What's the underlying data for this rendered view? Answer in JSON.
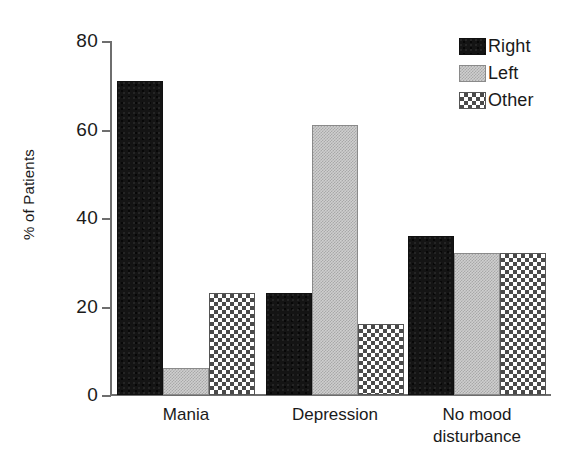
{
  "chart_data": {
    "type": "bar",
    "title": "",
    "subtitle": "",
    "xlabel": "",
    "ylabel": "% of Patients",
    "ylim": [
      0,
      80
    ],
    "yticks": [
      0,
      20,
      40,
      60,
      80
    ],
    "ytick_labels": [
      "0",
      "20",
      "40",
      "60",
      "80"
    ],
    "grid": false,
    "legend_position": "top-right",
    "categories": [
      "Mania",
      "Depression",
      "No mood\ndisturbance"
    ],
    "series": [
      {
        "name": "Right",
        "values": [
          71,
          23,
          36
        ],
        "pattern": "solid-black",
        "color": "#141414"
      },
      {
        "name": "Left",
        "values": [
          6,
          61,
          32
        ],
        "pattern": "fine-stipple",
        "color": "#cfcfcf"
      },
      {
        "name": "Other",
        "values": [
          23,
          16,
          32
        ],
        "pattern": "checkerboard",
        "color": "#4a4a4a"
      }
    ]
  },
  "axes": {
    "y_title": "% of Patients",
    "y_ticks": [
      {
        "label": "80",
        "value": 80
      },
      {
        "label": "60",
        "value": 60
      },
      {
        "label": "40",
        "value": 40
      },
      {
        "label": "20",
        "value": 20
      },
      {
        "label": "0",
        "value": 0
      }
    ]
  },
  "categories": [
    {
      "label": "Mania"
    },
    {
      "label": "Depression"
    },
    {
      "label": "No mood\ndisturbance"
    }
  ],
  "legend": {
    "items": [
      {
        "label": "Right"
      },
      {
        "label": "Left"
      },
      {
        "label": "Other"
      }
    ]
  }
}
